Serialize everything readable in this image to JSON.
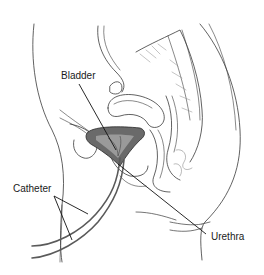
{
  "diagram": {
    "type": "anatomical-illustration",
    "labels": {
      "bladder": "Bladder",
      "catheter": "Catheter",
      "urethra": "Urethra"
    },
    "colors": {
      "background": "#ffffff",
      "line": "#2a2a2a",
      "bladder_fill": "#555555",
      "catheter": "#555555"
    }
  }
}
